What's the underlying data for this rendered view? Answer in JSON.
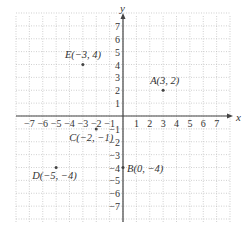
{
  "chart_data": {
    "type": "scatter",
    "title": "",
    "xlabel": "x",
    "ylabel": "y",
    "xlim": [
      -8,
      8
    ],
    "ylim": [
      -8,
      8
    ],
    "grid": true,
    "x_ticks": [
      "-7",
      "-6",
      "-5",
      "-4",
      "-3",
      "-2",
      "-1",
      "1",
      "2",
      "3",
      "4",
      "5",
      "6",
      "7"
    ],
    "y_ticks": [
      "7",
      "6",
      "5",
      "4",
      "3",
      "2",
      "1",
      "-1",
      "-2",
      "-3",
      "-4",
      "-5",
      "-6",
      "-7"
    ],
    "points": [
      {
        "name": "A",
        "label": "A(3, 2)",
        "x": 3,
        "y": 2
      },
      {
        "name": "B",
        "label": "B(0, −4)",
        "x": 0,
        "y": -4
      },
      {
        "name": "C",
        "label": "C(−2, −1)",
        "x": -2,
        "y": -1
      },
      {
        "name": "D",
        "label": "D(−5, −4)",
        "x": -5,
        "y": -4
      },
      {
        "name": "E",
        "label": "E(−3, 4)",
        "x": -3,
        "y": 4
      }
    ]
  },
  "axes": {
    "x_label": "x",
    "y_label": "y"
  },
  "colors": {
    "grid": "#bbbbbb",
    "axis": "#444444",
    "text": "#333333",
    "point": "#444444"
  }
}
